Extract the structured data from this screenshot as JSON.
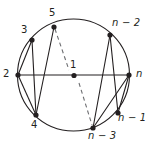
{
  "figure": {
    "type": "graph-diagram",
    "colors": {
      "stroke": "#231f20",
      "label": "#231f20",
      "background": "#ffffff",
      "dash": "#6d6e71"
    },
    "circle": {
      "cx": 73.5,
      "cy": 75,
      "r": 56,
      "stroke_width": 1.1
    },
    "vertices": [
      {
        "id": "v1",
        "label": "1",
        "style": "numeric",
        "x": 74,
        "y": 75.5,
        "label_x": 70,
        "label_y": 60
      },
      {
        "id": "v2",
        "label": "2",
        "style": "numeric",
        "x": 18,
        "y": 75,
        "label_x": 3,
        "label_y": 69
      },
      {
        "id": "v3",
        "label": "3",
        "style": "numeric",
        "x": 32,
        "y": 40,
        "label_x": 21,
        "label_y": 25
      },
      {
        "id": "v4",
        "label": "4",
        "style": "numeric",
        "x": 36,
        "y": 115,
        "label_x": 31,
        "label_y": 120
      },
      {
        "id": "v5",
        "label": "5",
        "style": "numeric",
        "x": 54,
        "y": 27,
        "label_x": 49,
        "label_y": 8
      },
      {
        "id": "vn",
        "label": "n",
        "style": "italic",
        "x": 129,
        "y": 75,
        "label_x": 136,
        "label_y": 69
      },
      {
        "id": "vn1",
        "label": "n − 1",
        "style": "italic",
        "x": 118,
        "y": 113,
        "label_x": 118,
        "label_y": 113
      },
      {
        "id": "vn2",
        "label": "n − 2",
        "style": "italic",
        "x": 110,
        "y": 35,
        "label_x": 112,
        "label_y": 18
      },
      {
        "id": "vn3",
        "label": "n − 3",
        "style": "italic",
        "x": 93,
        "y": 128,
        "label_x": 88,
        "label_y": 131
      }
    ],
    "vertex_radius": 2.6,
    "diameter": {
      "from": "v2",
      "to": "vn",
      "x1": 18,
      "y1": 75,
      "x2": 129,
      "y2": 75
    },
    "chords": [
      {
        "from": "v2",
        "to": "v3",
        "x1": 18,
        "y1": 75,
        "x2": 32,
        "y2": 40
      },
      {
        "from": "v2",
        "to": "v4",
        "x1": 18,
        "y1": 75,
        "x2": 36,
        "y2": 115
      },
      {
        "from": "v3",
        "to": "v4",
        "x1": 32,
        "y1": 40,
        "x2": 36,
        "y2": 115
      },
      {
        "from": "v5",
        "to": "v4",
        "x1": 54,
        "y1": 27,
        "x2": 36,
        "y2": 115
      },
      {
        "from": "vn2",
        "to": "vn1",
        "x1": 110,
        "y1": 35,
        "x2": 118,
        "y2": 113
      },
      {
        "from": "vn2",
        "to": "vn3",
        "x1": 110,
        "y1": 35,
        "x2": 93,
        "y2": 128
      },
      {
        "from": "vn",
        "to": "vn1",
        "x1": 129,
        "y1": 75,
        "x2": 118,
        "y2": 113
      },
      {
        "from": "vn",
        "to": "vn3",
        "x1": 129,
        "y1": 75,
        "x2": 93,
        "y2": 128
      }
    ],
    "dashed_segments": [
      {
        "from": "v5",
        "to": "v1",
        "x1": 55,
        "y1": 29,
        "x2": 69,
        "y2": 70
      },
      {
        "from": "v1",
        "to": "vn3",
        "x1": 79,
        "y1": 83,
        "x2": 92,
        "y2": 125
      }
    ]
  }
}
